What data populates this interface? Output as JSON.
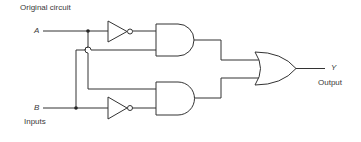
{
  "diagram": {
    "title": "Original circuit",
    "inputs": [
      {
        "name": "A"
      },
      {
        "name": "B"
      }
    ],
    "inputs_label": "Inputs",
    "output": {
      "name": "Y",
      "label": "Output"
    },
    "gates": [
      {
        "id": "not-a",
        "type": "NOT",
        "input": "A"
      },
      {
        "id": "not-b",
        "type": "NOT",
        "input": "B"
      },
      {
        "id": "and-1",
        "type": "AND",
        "inputs": [
          "NOT A",
          "B"
        ]
      },
      {
        "id": "and-2",
        "type": "AND",
        "inputs": [
          "A",
          "NOT B"
        ]
      },
      {
        "id": "or-1",
        "type": "OR",
        "inputs": [
          "and-1",
          "and-2"
        ],
        "output": "Y"
      }
    ]
  }
}
